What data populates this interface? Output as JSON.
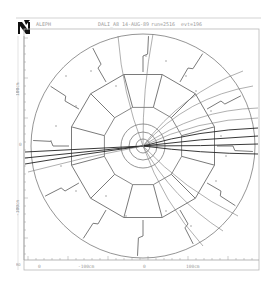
{
  "header": {
    "logo": "aleph-logo-icon",
    "experiment": "ALEPH",
    "program": "DALI_A8",
    "date": "14-AUG-89",
    "run": "run=2516",
    "event": "evt=196"
  },
  "axes": {
    "y_label_top": "100cm",
    "y_label_bottom": "-100cm",
    "y_zero": "0",
    "x_label_left": "-100cm",
    "x_label_right": "100cm",
    "x_zero": "0",
    "x_corner": "0",
    "corner_label": "RO"
  },
  "display": {
    "view": "rho-phi",
    "line_color": "#7a7a7a",
    "track_color": "#222222",
    "frame_color": "#b0b0b0"
  }
}
